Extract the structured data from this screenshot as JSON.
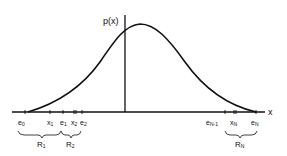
{
  "diagram": {
    "y_axis_label": "p(x)",
    "x_axis_label": "x",
    "ticks": [
      {
        "name": "e",
        "sub": "0",
        "x": 28
      },
      {
        "name": "x",
        "sub": "1",
        "x": 50
      },
      {
        "name": "e",
        "sub": "1",
        "x": 63
      },
      {
        "name": "x",
        "sub": "2",
        "x": 75
      },
      {
        "name": "e",
        "sub": "2",
        "x": 82
      },
      {
        "name": "e",
        "sub": "N-1",
        "x": 226
      },
      {
        "name": "x",
        "sub": "N",
        "x": 236
      },
      {
        "name": "e",
        "sub": "N",
        "x": 256
      }
    ],
    "regions": [
      {
        "name": "R",
        "sub": "1"
      },
      {
        "name": "R",
        "sub": "2"
      },
      {
        "name": "R",
        "sub": "N"
      }
    ]
  }
}
